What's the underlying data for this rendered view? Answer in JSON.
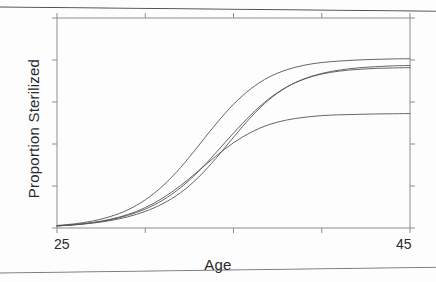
{
  "figure": {
    "axis_color": "#8d8d92",
    "curve_color": "#55555c",
    "text_color": "#2a2a2e"
  },
  "axes": {
    "x_title": "Age",
    "y_title": "Proportion Sterilized",
    "x_tick_labels": [
      "25",
      "45"
    ],
    "y_tick_labels": []
  },
  "chart_data": {
    "type": "line",
    "title": "",
    "xlabel": "Age",
    "ylabel": "Proportion Sterilized",
    "xlim": [
      25,
      45
    ],
    "ylim": [
      0,
      1
    ],
    "grid": false,
    "legend": "none",
    "x_ticks": [
      25,
      30,
      35,
      40,
      45
    ],
    "x_tick_labels_shown": [
      "25",
      "",
      "",
      "",
      "45"
    ],
    "y_ticks": [
      0.0,
      0.2,
      0.4,
      0.6,
      0.8,
      1.0
    ],
    "y_tick_labels_shown": [
      "",
      "",
      "",
      "",
      "",
      ""
    ],
    "box_frame": true,
    "tick_direction": "out",
    "x": [
      25,
      26,
      27,
      28,
      29,
      30,
      31,
      32,
      33,
      34,
      35,
      36,
      37,
      38,
      39,
      40,
      41,
      42,
      43,
      44,
      45
    ],
    "series": [
      {
        "name": "curve-1",
        "note": "highest, earliest rise",
        "values": [
          0.012,
          0.02,
          0.033,
          0.054,
          0.086,
          0.134,
          0.201,
          0.288,
          0.39,
          0.495,
          0.589,
          0.664,
          0.718,
          0.753,
          0.775,
          0.788,
          0.795,
          0.8,
          0.803,
          0.805,
          0.806
        ]
      },
      {
        "name": "curve-2",
        "note": "second highest plateau",
        "values": [
          0.01,
          0.016,
          0.025,
          0.039,
          0.06,
          0.09,
          0.133,
          0.192,
          0.268,
          0.358,
          0.452,
          0.54,
          0.615,
          0.671,
          0.71,
          0.736,
          0.752,
          0.762,
          0.768,
          0.772,
          0.774
        ]
      },
      {
        "name": "curve-3",
        "note": "third plateau, latest steep rise",
        "values": [
          0.01,
          0.015,
          0.023,
          0.035,
          0.053,
          0.079,
          0.116,
          0.168,
          0.24,
          0.331,
          0.432,
          0.529,
          0.61,
          0.67,
          0.709,
          0.733,
          0.747,
          0.755,
          0.76,
          0.762,
          0.764
        ]
      },
      {
        "name": "curve-4",
        "note": "lowest plateau",
        "values": [
          0.01,
          0.016,
          0.026,
          0.041,
          0.064,
          0.097,
          0.143,
          0.202,
          0.271,
          0.342,
          0.406,
          0.456,
          0.492,
          0.514,
          0.527,
          0.535,
          0.539,
          0.541,
          0.543,
          0.544,
          0.545
        ]
      }
    ]
  }
}
